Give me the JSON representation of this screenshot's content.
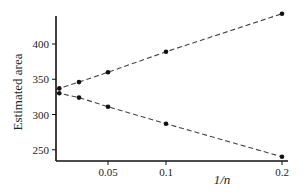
{
  "chart_data": {
    "type": "line",
    "title": "",
    "xlabel": "1/n",
    "ylabel": "Estimated area",
    "xlim": [
      0,
      0.2
    ],
    "ylim": [
      240,
      445
    ],
    "x_ticks": [
      {
        "value": 0.05,
        "label": "0.05"
      },
      {
        "value": 0.1,
        "label": "0.1"
      },
      {
        "value": 0.2,
        "label": "0.2"
      }
    ],
    "y_ticks": [
      {
        "value": 250,
        "label": "250"
      },
      {
        "value": 300,
        "label": "300"
      },
      {
        "value": 350,
        "label": "350"
      },
      {
        "value": 400,
        "label": "400"
      }
    ],
    "grid": false,
    "legend": null,
    "line_style": "dashed",
    "marker": "filled-circle",
    "series": [
      {
        "name": "upper estimate",
        "x": [
          0.008,
          0.025,
          0.05,
          0.1,
          0.2
        ],
        "values": [
          337,
          346,
          360,
          389,
          443
        ]
      },
      {
        "name": "lower estimate",
        "x": [
          0.008,
          0.025,
          0.05,
          0.1,
          0.2
        ],
        "values": [
          330,
          324,
          311,
          287,
          240
        ]
      }
    ],
    "colors": {
      "axis": "#111111",
      "line": "#444444",
      "marker": "#111111"
    }
  }
}
